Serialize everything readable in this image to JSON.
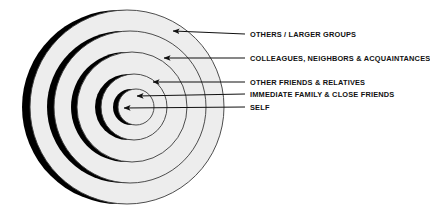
{
  "diagram": {
    "background_color": "#ffffff",
    "ring_fill_color": "#ededed",
    "ring_stroke_color": "#3a3a3a",
    "shadow_color": "#000000",
    "arrow_color": "#111111",
    "label_color": "#111111",
    "rings": [
      {
        "id": "ring-others-larger-groups",
        "label": "OTHERS / LARGER GROUPS",
        "level": 5,
        "radius": 97,
        "center_x": 127,
        "center_y": 107,
        "shadow_offset_x": -8
      },
      {
        "id": "ring-colleagues-neighbors-acquaintances",
        "label": "COLLEAGUES, NEIGHBORS & ACQUAINTANCES",
        "level": 4,
        "radius": 76,
        "center_x": 130,
        "center_y": 107,
        "shadow_offset_x": -7
      },
      {
        "id": "ring-other-friends-relatives",
        "label": "OTHER FRIENDS & RELATIVES",
        "level": 3,
        "radius": 55,
        "center_x": 132,
        "center_y": 107,
        "shadow_offset_x": -6
      },
      {
        "id": "ring-immediate-family-close-friends",
        "label": "IMMEDIATE FAMILY & CLOSE FRIENDS",
        "level": 2,
        "radius": 33,
        "center_x": 134,
        "center_y": 107,
        "shadow_offset_x": -6
      },
      {
        "id": "ring-self",
        "label": "SELF",
        "level": 1,
        "radius": 18,
        "center_x": 136,
        "center_y": 107,
        "shadow_offset_x": -5
      }
    ],
    "labels": [
      {
        "text": "OTHERS / LARGER GROUPS",
        "x": 250,
        "y": 30
      },
      {
        "text": "COLLEAGUES, NEIGHBORS & ACQUAINTANCES",
        "x": 250,
        "y": 54
      },
      {
        "text": "OTHER FRIENDS & RELATIVES",
        "x": 250,
        "y": 78
      },
      {
        "text": "IMMEDIATE FAMILY & CLOSE FRIENDS",
        "x": 250,
        "y": 90
      },
      {
        "text": "SELF",
        "x": 250,
        "y": 103
      }
    ],
    "arrows": [
      {
        "id": "arrow-others-larger-groups",
        "tail_x": 245,
        "tail_y": 34,
        "head_x": 173,
        "head_y": 31
      },
      {
        "id": "arrow-colleagues",
        "tail_x": 245,
        "tail_y": 58,
        "head_x": 164,
        "head_y": 58
      },
      {
        "id": "arrow-other-friends",
        "tail_x": 245,
        "tail_y": 82,
        "head_x": 153,
        "head_y": 82
      },
      {
        "id": "arrow-immediate-family",
        "tail_x": 245,
        "tail_y": 94,
        "head_x": 137,
        "head_y": 96
      },
      {
        "id": "arrow-self",
        "tail_x": 245,
        "tail_y": 107,
        "head_x": 124,
        "head_y": 108
      }
    ]
  }
}
